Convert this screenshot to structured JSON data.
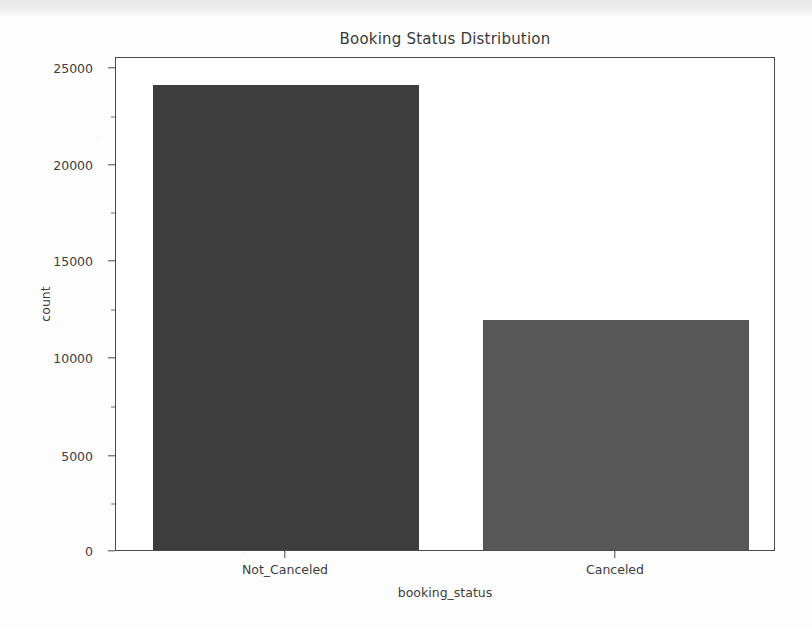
{
  "chart_data": {
    "type": "bar",
    "title": "Booking Status Distribution",
    "xlabel": "booking_status",
    "ylabel": "count",
    "categories": [
      "Not_Canceled",
      "Canceled"
    ],
    "values": [
      24500,
      12100
    ],
    "series": [
      {
        "name": "count",
        "values": [
          24500,
          12100
        ]
      }
    ],
    "ylim": [
      0,
      26000
    ],
    "yticks": [
      0,
      5000,
      10000,
      15000,
      20000,
      25000
    ],
    "ytick_labels": [
      "0",
      "5000",
      "10000",
      "15000",
      "20000",
      "25000"
    ],
    "grid": false,
    "legend": "none",
    "bar_colors": [
      "#3d3d3d",
      "#575757"
    ],
    "axis_color": "#4a4a4a",
    "text_color": "#3d3d3d",
    "background": "#ffffff"
  }
}
